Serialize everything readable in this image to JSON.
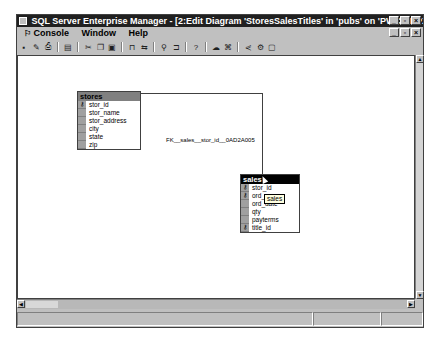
{
  "window": {
    "title": "SQL Server Enterprise Manager - [2:Edit Diagram 'StoresSalesTitles' in 'pubs' on 'PWC.M1PX5R47B6R']",
    "controls": [
      "minimize",
      "maximize",
      "close"
    ]
  },
  "menubar": {
    "items": [
      {
        "label": "Console",
        "icon": "console-icon"
      },
      {
        "label": "Window"
      },
      {
        "label": "Help"
      }
    ]
  },
  "toolbar": {
    "buttons": [
      {
        "name": "save",
        "glyph": "▪"
      },
      {
        "name": "properties",
        "glyph": "✎"
      },
      {
        "name": "print",
        "glyph": "⎙"
      },
      {
        "name": "copy-diagram",
        "glyph": "▤"
      },
      {
        "name": "cut",
        "glyph": "✂"
      },
      {
        "name": "copy",
        "glyph": "❐"
      },
      {
        "name": "paste",
        "glyph": "▣"
      },
      {
        "name": "new-table",
        "glyph": "⊓"
      },
      {
        "name": "add-table",
        "glyph": "⇆"
      },
      {
        "name": "zoom",
        "glyph": "⚲"
      },
      {
        "name": "layout",
        "glyph": "⊐"
      },
      {
        "name": "help",
        "glyph": "?"
      },
      {
        "name": "indexes",
        "glyph": "☁"
      },
      {
        "name": "relationships",
        "glyph": "⌘"
      },
      {
        "name": "arrange",
        "glyph": "⋞"
      },
      {
        "name": "show-labels",
        "glyph": "⚙"
      },
      {
        "name": "page-breaks",
        "glyph": "▢"
      }
    ]
  },
  "diagram": {
    "tables": [
      {
        "name": "stores",
        "active": false,
        "columns": [
          {
            "name": "stor_id",
            "key": true
          },
          {
            "name": "stor_name",
            "key": false
          },
          {
            "name": "stor_address",
            "key": false
          },
          {
            "name": "city",
            "key": false
          },
          {
            "name": "state",
            "key": false
          },
          {
            "name": "zip",
            "key": false
          }
        ]
      },
      {
        "name": "sales",
        "active": true,
        "columns": [
          {
            "name": "stor_id",
            "key": true
          },
          {
            "name": "ord_num",
            "key": true
          },
          {
            "name": "ord_date",
            "key": false
          },
          {
            "name": "qty",
            "key": false
          },
          {
            "name": "payterms",
            "key": false
          },
          {
            "name": "title_id",
            "key": true
          }
        ]
      }
    ],
    "relationship": {
      "label": "FK__sales__stor_id__0AD2A005"
    },
    "tooltip": "sales"
  },
  "statusbar": {
    "panes": [
      "",
      "",
      ""
    ]
  }
}
